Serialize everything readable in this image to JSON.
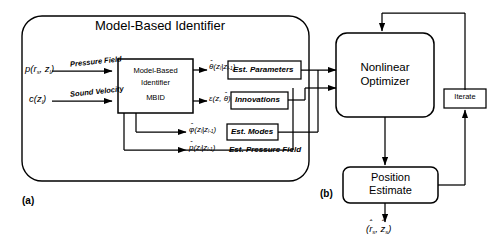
{
  "figure": {
    "panel_a_label": "(a)",
    "panel_b_label": "(b)",
    "outer_box_title": "Model-Based Identifier"
  },
  "blocks": {
    "mbid": {
      "line1": "Model-Based",
      "line2": "Identifier",
      "line3": "MBID"
    },
    "est_parameters": "Est. Parameters",
    "innovations": "Innovations",
    "est_modes": "Est. Modes",
    "est_pressure_field": "Est. Pressure Field",
    "nonlinear_optimizer": {
      "line1": "Nonlinear",
      "line2": "Optimizer"
    },
    "iterate": "Iterate",
    "position_estimate": {
      "line1": "Position",
      "line2": "Estimate"
    }
  },
  "signals": {
    "input_pressure_label": "Pressure Field",
    "input_sound_label": "Sound Velocity",
    "input_pressure_var_p": "p",
    "input_pressure_var_args": "(r",
    "input_pressure_sub_s": "s",
    "input_pressure_mid": ", z",
    "input_pressure_sub_l": "l",
    "input_pressure_close": ")",
    "input_sound_var": "c",
    "input_sound_open": "(z",
    "input_sound_sub_l": "l",
    "input_sound_close": ")",
    "theta_base": "θ",
    "theta_args": "(z",
    "theta_sub1": "l",
    "theta_mid": "|z",
    "theta_sub2": "l-1",
    "theta_close": ")",
    "eps_base": "ε",
    "eps_args": "(z, ",
    "eps_theta": "θ",
    "eps_close": ")",
    "phi_base": "φ",
    "phi_args": "(z",
    "phi_sub1": "l",
    "phi_mid": "|z",
    "phi_sub2": "l-1",
    "phi_close": ")",
    "p_base": "p",
    "p_args": "(z",
    "p_sub1": "l",
    "p_mid": "|z",
    "p_sub2": "l-1",
    "p_close": ")",
    "output_open": "(",
    "output_r": "r",
    "output_r_sub": "s",
    "output_comma": ", ",
    "output_z": "z",
    "output_z_sub": "s",
    "output_close": ")",
    "hat_mark": "ˆ"
  },
  "style": {
    "line_color": "#000000",
    "background": "#ffffff"
  }
}
